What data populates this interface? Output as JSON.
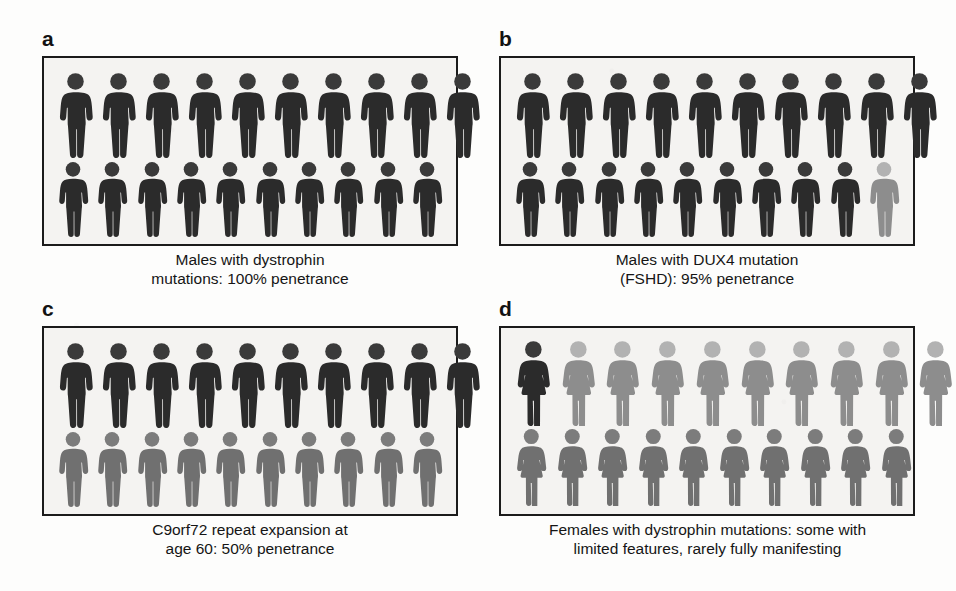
{
  "figure": {
    "type": "pictogram-panels",
    "panel_count": 4,
    "columns_per_row": 10,
    "rows_per_panel": 2,
    "total_icons_per_panel": 20,
    "colors": {
      "affected_dark": "#2b2b2b",
      "unaffected_light": "#8d8d8d",
      "partial_medium": "#707070",
      "head_dark": "#3a3a3a",
      "head_light": "#b2b2b2",
      "head_medium": "#7c7c7c",
      "box_border": "#1b1b1b",
      "box_fill": "#f4f3f1",
      "text": "#151515"
    }
  },
  "panels": [
    {
      "id": "a",
      "letter": "a",
      "icon_type": "male",
      "caption_lines": [
        "Males with dystrophin",
        "mutations: 100% penetrance"
      ],
      "caption_full": "Males with dystrophin mutations: 100% penetrance",
      "penetrance_percent": 100,
      "affected_count": 20,
      "unaffected_count": 0,
      "rows": [
        {
          "row": 1,
          "states": [
            "affected",
            "affected",
            "affected",
            "affected",
            "affected",
            "affected",
            "affected",
            "affected",
            "affected",
            "affected"
          ]
        },
        {
          "row": 2,
          "states": [
            "affected",
            "affected",
            "affected",
            "affected",
            "affected",
            "affected",
            "affected",
            "affected",
            "affected",
            "affected"
          ]
        }
      ]
    },
    {
      "id": "b",
      "letter": "b",
      "icon_type": "male",
      "caption_lines": [
        "Males with DUX4 mutation",
        "(FSHD): 95% penetrance"
      ],
      "caption_full": "Males with DUX4 mutation (FSHD): 95% penetrance",
      "penetrance_percent": 95,
      "affected_count": 19,
      "unaffected_count": 1,
      "rows": [
        {
          "row": 1,
          "states": [
            "affected",
            "affected",
            "affected",
            "affected",
            "affected",
            "affected",
            "affected",
            "affected",
            "affected",
            "affected"
          ]
        },
        {
          "row": 2,
          "states": [
            "affected",
            "affected",
            "affected",
            "affected",
            "affected",
            "affected",
            "affected",
            "affected",
            "affected",
            "unaffected"
          ]
        }
      ]
    },
    {
      "id": "c",
      "letter": "c",
      "icon_type": "male",
      "caption_lines": [
        "C9orf72 repeat expansion at",
        "age 60: 50% penetrance"
      ],
      "caption_full": "C9orf72 repeat expansion at age 60: 50% penetrance",
      "penetrance_percent": 50,
      "affected_count": 10,
      "unaffected_count": 10,
      "rows": [
        {
          "row": 1,
          "states": [
            "affected",
            "affected",
            "affected",
            "affected",
            "affected",
            "affected",
            "affected",
            "affected",
            "affected",
            "affected"
          ]
        },
        {
          "row": 2,
          "states": [
            "partial",
            "partial",
            "partial",
            "partial",
            "partial",
            "partial",
            "partial",
            "partial",
            "partial",
            "partial"
          ]
        }
      ]
    },
    {
      "id": "d",
      "letter": "d",
      "icon_type": "female",
      "caption_lines": [
        "Females with dystrophin mutations: some with",
        "limited features, rarely fully manifesting"
      ],
      "caption_full": "Females with dystrophin mutations: some with limited features, rarely fully manifesting",
      "penetrance_percent": null,
      "affected_count": 1,
      "unaffected_count": 9,
      "partial_count": 10,
      "rows": [
        {
          "row": 1,
          "states": [
            "affected",
            "unaffected",
            "unaffected",
            "unaffected",
            "unaffected",
            "unaffected",
            "unaffected",
            "unaffected",
            "unaffected",
            "unaffected"
          ]
        },
        {
          "row": 2,
          "states": [
            "partial",
            "partial",
            "partial",
            "partial",
            "partial",
            "partial",
            "partial",
            "partial",
            "partial",
            "partial"
          ]
        }
      ]
    }
  ]
}
